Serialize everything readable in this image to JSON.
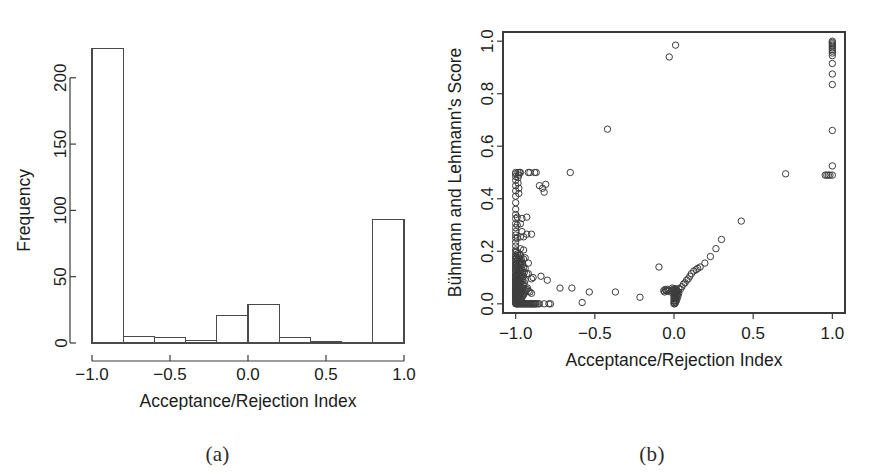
{
  "figure": {
    "background": "#ffffff",
    "ink_color": "#3a3a3a",
    "text_color": "#1c1c1c"
  },
  "panels": [
    {
      "id": "a",
      "caption": "(a)",
      "chart_ref": 0
    },
    {
      "id": "b",
      "caption": "(b)",
      "chart_ref": 1
    }
  ],
  "chart_data": [
    {
      "type": "bar",
      "subtype": "histogram",
      "title": "",
      "xlabel": "Acceptance/Rejection Index",
      "ylabel": "Frequency",
      "xlim": [
        -1.0,
        1.0
      ],
      "ylim": [
        0,
        230
      ],
      "xticks": [
        -1.0,
        -0.5,
        0.0,
        0.5,
        1.0
      ],
      "xtick_labels": [
        "-1.0",
        "-0.5",
        "0.0",
        "0.5",
        "1.0"
      ],
      "yticks": [
        0,
        50,
        100,
        150,
        200
      ],
      "ytick_labels": [
        "0",
        "50",
        "100",
        "150",
        "200"
      ],
      "grid": false,
      "legend": "none",
      "bin_width": 0.2,
      "bin_edges": [
        -1.0,
        -0.8,
        -0.6,
        -0.4,
        -0.2,
        0.0,
        0.2,
        0.4,
        0.6,
        0.8,
        1.0
      ],
      "categories": [
        "-1.0 to -0.8",
        "-0.8 to -0.6",
        "-0.6 to -0.4",
        "-0.4 to -0.2",
        "-0.2 to 0.0",
        "0.0 to 0.2",
        "0.2 to 0.4",
        "0.4 to 0.6",
        "0.6 to 0.8",
        "0.8 to 1.0"
      ],
      "values": [
        222,
        5,
        4,
        2,
        21,
        29,
        4,
        1,
        0,
        93
      ],
      "bar_fill": "#ffffff",
      "bar_stroke": "#4a4a4a"
    },
    {
      "type": "scatter",
      "title": "",
      "xlabel": "Acceptance/Rejection Index",
      "ylabel": "Bühmann and Lehmann's Score",
      "xlim": [
        -1.08,
        1.08
      ],
      "ylim": [
        -0.035,
        1.035
      ],
      "xticks": [
        -1.0,
        -0.5,
        0.0,
        0.5,
        1.0
      ],
      "xtick_labels": [
        "-1.0",
        "-0.5",
        "0.0",
        "0.5",
        "1.0"
      ],
      "yticks": [
        0.0,
        0.2,
        0.4,
        0.6,
        0.8,
        1.0
      ],
      "ytick_labels": [
        "0.0",
        "0.2",
        "0.4",
        "0.6",
        "0.8",
        "1.0"
      ],
      "grid": false,
      "legend": "none",
      "marker": "open-circle",
      "marker_size": 4.2,
      "marker_stroke": "#3d3d3d",
      "frame": true,
      "points": [
        [
          -1.0,
          0.0
        ],
        [
          -1.0,
          0.005
        ],
        [
          -1.0,
          0.01
        ],
        [
          -1.0,
          0.013
        ],
        [
          -1.0,
          0.017
        ],
        [
          -1.0,
          0.02
        ],
        [
          -1.0,
          0.024
        ],
        [
          -1.0,
          0.028
        ],
        [
          -1.0,
          0.032
        ],
        [
          -1.0,
          0.036
        ],
        [
          -1.0,
          0.04
        ],
        [
          -1.0,
          0.044
        ],
        [
          -1.0,
          0.048
        ],
        [
          -1.0,
          0.052
        ],
        [
          -1.0,
          0.056
        ],
        [
          -1.0,
          0.06
        ],
        [
          -1.0,
          0.065
        ],
        [
          -1.0,
          0.07
        ],
        [
          -1.0,
          0.075
        ],
        [
          -1.0,
          0.08
        ],
        [
          -1.0,
          0.085
        ],
        [
          -1.0,
          0.09
        ],
        [
          -1.0,
          0.095
        ],
        [
          -1.0,
          0.1
        ],
        [
          -1.0,
          0.105
        ],
        [
          -1.0,
          0.11
        ],
        [
          -1.0,
          0.118
        ],
        [
          -1.0,
          0.125
        ],
        [
          -1.0,
          0.132
        ],
        [
          -1.0,
          0.14
        ],
        [
          -1.0,
          0.148
        ],
        [
          -1.0,
          0.155
        ],
        [
          -1.0,
          0.162
        ],
        [
          -1.0,
          0.17
        ],
        [
          -1.0,
          0.178
        ],
        [
          -1.0,
          0.185
        ],
        [
          -1.0,
          0.195
        ],
        [
          -1.0,
          0.205
        ],
        [
          -1.0,
          0.22
        ],
        [
          -1.0,
          0.235
        ],
        [
          -1.0,
          0.25
        ],
        [
          -1.0,
          0.262
        ],
        [
          -1.0,
          0.275
        ],
        [
          -1.0,
          0.29
        ],
        [
          -1.0,
          0.305
        ],
        [
          -1.0,
          0.325
        ],
        [
          -1.0,
          0.34
        ],
        [
          -1.0,
          0.36
        ],
        [
          -1.0,
          0.385
        ],
        [
          -1.0,
          0.41
        ],
        [
          -1.0,
          0.43
        ],
        [
          -1.0,
          0.45
        ],
        [
          -1.0,
          0.47
        ],
        [
          -1.0,
          0.485
        ],
        [
          -1.0,
          0.495
        ],
        [
          -1.0,
          0.5
        ],
        [
          -0.995,
          0.0
        ],
        [
          -0.995,
          0.015
        ],
        [
          -0.995,
          0.03
        ],
        [
          -0.995,
          0.045
        ],
        [
          -0.995,
          0.06
        ],
        [
          -0.995,
          0.075
        ],
        [
          -0.995,
          0.09
        ],
        [
          -0.995,
          0.11
        ],
        [
          -0.995,
          0.13
        ],
        [
          -0.995,
          0.15
        ],
        [
          -0.995,
          0.175
        ],
        [
          -0.995,
          0.2
        ],
        [
          -0.99,
          0.0
        ],
        [
          -0.99,
          0.008
        ],
        [
          -0.99,
          0.018
        ],
        [
          -0.99,
          0.028
        ],
        [
          -0.99,
          0.038
        ],
        [
          -0.99,
          0.05
        ],
        [
          -0.99,
          0.062
        ],
        [
          -0.99,
          0.078
        ],
        [
          -0.99,
          0.095
        ],
        [
          -0.99,
          0.115
        ],
        [
          -0.99,
          0.14
        ],
        [
          -0.99,
          0.165
        ],
        [
          -0.99,
          0.19
        ],
        [
          -0.99,
          0.25
        ],
        [
          -0.99,
          0.3
        ],
        [
          -0.99,
          0.33
        ],
        [
          -0.985,
          0.0
        ],
        [
          -0.985,
          0.012
        ],
        [
          -0.985,
          0.025
        ],
        [
          -0.985,
          0.04
        ],
        [
          -0.985,
          0.055
        ],
        [
          -0.985,
          0.07
        ],
        [
          -0.985,
          0.088
        ],
        [
          -0.985,
          0.108
        ],
        [
          -0.985,
          0.13
        ],
        [
          -0.985,
          0.155
        ],
        [
          -0.985,
          0.185
        ],
        [
          -0.985,
          0.46
        ],
        [
          -0.985,
          0.48
        ],
        [
          -0.985,
          0.5
        ],
        [
          -0.98,
          0.0
        ],
        [
          -0.98,
          0.01
        ],
        [
          -0.98,
          0.022
        ],
        [
          -0.98,
          0.035
        ],
        [
          -0.98,
          0.05
        ],
        [
          -0.98,
          0.065
        ],
        [
          -0.98,
          0.082
        ],
        [
          -0.98,
          0.1
        ],
        [
          -0.98,
          0.125
        ],
        [
          -0.98,
          0.15
        ],
        [
          -0.98,
          0.175
        ],
        [
          -0.98,
          0.42
        ],
        [
          -0.98,
          0.44
        ],
        [
          -0.98,
          0.49
        ],
        [
          -0.975,
          0.0
        ],
        [
          -0.975,
          0.015
        ],
        [
          -0.975,
          0.032
        ],
        [
          -0.975,
          0.048
        ],
        [
          -0.975,
          0.065
        ],
        [
          -0.975,
          0.085
        ],
        [
          -0.975,
          0.105
        ],
        [
          -0.975,
          0.13
        ],
        [
          -0.975,
          0.16
        ],
        [
          -0.975,
          0.185
        ],
        [
          -0.975,
          0.5
        ],
        [
          -0.97,
          0.0
        ],
        [
          -0.97,
          0.018
        ],
        [
          -0.97,
          0.038
        ],
        [
          -0.97,
          0.058
        ],
        [
          -0.97,
          0.078
        ],
        [
          -0.97,
          0.1
        ],
        [
          -0.97,
          0.125
        ],
        [
          -0.97,
          0.155
        ],
        [
          -0.97,
          0.185
        ],
        [
          -0.97,
          0.21
        ],
        [
          -0.97,
          0.255
        ],
        [
          -0.97,
          0.305
        ],
        [
          -0.97,
          0.5
        ],
        [
          -0.965,
          0.0
        ],
        [
          -0.965,
          0.02
        ],
        [
          -0.965,
          0.042
        ],
        [
          -0.965,
          0.062
        ],
        [
          -0.965,
          0.085
        ],
        [
          -0.965,
          0.11
        ],
        [
          -0.965,
          0.14
        ],
        [
          -0.965,
          0.17
        ],
        [
          -0.96,
          0.0
        ],
        [
          -0.96,
          0.025
        ],
        [
          -0.96,
          0.05
        ],
        [
          -0.96,
          0.075
        ],
        [
          -0.96,
          0.1
        ],
        [
          -0.96,
          0.13
        ],
        [
          -0.96,
          0.16
        ],
        [
          -0.96,
          0.275
        ],
        [
          -0.96,
          0.325
        ],
        [
          -0.955,
          0.0
        ],
        [
          -0.955,
          0.03
        ],
        [
          -0.955,
          0.06
        ],
        [
          -0.955,
          0.09
        ],
        [
          -0.955,
          0.12
        ],
        [
          -0.955,
          0.15
        ],
        [
          -0.95,
          0.0
        ],
        [
          -0.95,
          0.035
        ],
        [
          -0.95,
          0.07
        ],
        [
          -0.95,
          0.105
        ],
        [
          -0.95,
          0.14
        ],
        [
          -0.95,
          0.17
        ],
        [
          -0.95,
          0.205
        ],
        [
          -0.95,
          0.255
        ],
        [
          -0.945,
          0.0
        ],
        [
          -0.945,
          0.04
        ],
        [
          -0.945,
          0.08
        ],
        [
          -0.945,
          0.12
        ],
        [
          -0.94,
          0.0
        ],
        [
          -0.94,
          0.045
        ],
        [
          -0.94,
          0.09
        ],
        [
          -0.94,
          0.135
        ],
        [
          -0.94,
          0.175
        ],
        [
          -0.935,
          0.0
        ],
        [
          -0.935,
          0.05
        ],
        [
          -0.93,
          0.0
        ],
        [
          -0.93,
          0.055
        ],
        [
          -0.93,
          0.115
        ],
        [
          -0.93,
          0.265
        ],
        [
          -0.93,
          0.33
        ],
        [
          -0.925,
          0.0
        ],
        [
          -0.925,
          0.06
        ],
        [
          -0.92,
          0.0
        ],
        [
          -0.92,
          0.048
        ],
        [
          -0.92,
          0.115
        ],
        [
          -0.92,
          0.155
        ],
        [
          -0.92,
          0.5
        ],
        [
          -0.915,
          0.0
        ],
        [
          -0.91,
          0.0
        ],
        [
          -0.91,
          0.045
        ],
        [
          -0.91,
          0.5
        ],
        [
          -0.905,
          0.0
        ],
        [
          -0.9,
          0.0
        ],
        [
          -0.9,
          0.04
        ],
        [
          -0.9,
          0.095
        ],
        [
          -0.9,
          0.265
        ],
        [
          -0.895,
          0.0
        ],
        [
          -0.89,
          0.0
        ],
        [
          -0.89,
          0.1
        ],
        [
          -0.885,
          0.0
        ],
        [
          -0.88,
          0.0
        ],
        [
          -0.88,
          0.5
        ],
        [
          -0.875,
          0.0
        ],
        [
          -0.87,
          0.0
        ],
        [
          -0.87,
          0.5
        ],
        [
          -0.86,
          0.0
        ],
        [
          -0.85,
          0.0
        ],
        [
          -0.85,
          0.45
        ],
        [
          -0.84,
          0.105
        ],
        [
          -0.83,
          0.44
        ],
        [
          -0.82,
          0.0
        ],
        [
          -0.82,
          0.425
        ],
        [
          -0.81,
          0.455
        ],
        [
          -0.8,
          0.09
        ],
        [
          -0.79,
          0.0
        ],
        [
          -0.78,
          0.0
        ],
        [
          -0.72,
          0.06
        ],
        [
          -0.655,
          0.5
        ],
        [
          -0.645,
          0.06
        ],
        [
          -0.58,
          0.005
        ],
        [
          -0.535,
          0.045
        ],
        [
          -0.42,
          0.665
        ],
        [
          -0.37,
          0.045
        ],
        [
          -0.215,
          0.025
        ],
        [
          -0.095,
          0.14
        ],
        [
          -0.065,
          0.05
        ],
        [
          -0.06,
          0.045
        ],
        [
          -0.055,
          0.055
        ],
        [
          -0.05,
          0.05
        ],
        [
          -0.045,
          0.048
        ],
        [
          -0.04,
          0.055
        ],
        [
          -0.035,
          0.05
        ],
        [
          -0.03,
          0.94
        ],
        [
          -0.02,
          0.045
        ],
        [
          -0.015,
          0.05
        ],
        [
          -0.01,
          0.06
        ],
        [
          -0.005,
          0.055
        ],
        [
          0.0,
          0.0
        ],
        [
          0.0,
          0.005
        ],
        [
          0.0,
          0.012
        ],
        [
          0.0,
          0.02
        ],
        [
          0.0,
          0.028
        ],
        [
          0.0,
          0.035
        ],
        [
          0.0,
          0.042
        ],
        [
          0.0,
          0.05
        ],
        [
          0.005,
          0.0
        ],
        [
          0.005,
          0.01
        ],
        [
          0.005,
          0.022
        ],
        [
          0.005,
          0.033
        ],
        [
          0.005,
          0.045
        ],
        [
          0.005,
          0.058
        ],
        [
          0.01,
          0.005
        ],
        [
          0.01,
          0.018
        ],
        [
          0.01,
          0.03
        ],
        [
          0.01,
          0.042
        ],
        [
          0.01,
          0.055
        ],
        [
          0.01,
          0.985
        ],
        [
          0.015,
          0.012
        ],
        [
          0.015,
          0.025
        ],
        [
          0.015,
          0.04
        ],
        [
          0.015,
          0.052
        ],
        [
          0.02,
          0.02
        ],
        [
          0.02,
          0.035
        ],
        [
          0.02,
          0.05
        ],
        [
          0.025,
          0.03
        ],
        [
          0.025,
          0.045
        ],
        [
          0.03,
          0.04
        ],
        [
          0.03,
          0.058
        ],
        [
          0.04,
          0.055
        ],
        [
          0.05,
          0.065
        ],
        [
          0.06,
          0.075
        ],
        [
          0.07,
          0.08
        ],
        [
          0.08,
          0.09
        ],
        [
          0.09,
          0.095
        ],
        [
          0.1,
          0.105
        ],
        [
          0.11,
          0.115
        ],
        [
          0.125,
          0.125
        ],
        [
          0.14,
          0.13
        ],
        [
          0.15,
          0.135
        ],
        [
          0.165,
          0.14
        ],
        [
          0.195,
          0.155
        ],
        [
          0.23,
          0.18
        ],
        [
          0.265,
          0.21
        ],
        [
          0.3,
          0.245
        ],
        [
          0.425,
          0.315
        ],
        [
          0.705,
          0.495
        ],
        [
          0.955,
          0.49
        ],
        [
          0.965,
          0.49
        ],
        [
          0.975,
          0.49
        ],
        [
          0.985,
          0.49
        ],
        [
          1.0,
          0.49
        ],
        [
          1.0,
          0.525
        ],
        [
          1.0,
          0.66
        ],
        [
          1.0,
          0.835
        ],
        [
          1.0,
          0.875
        ],
        [
          1.0,
          0.915
        ],
        [
          1.0,
          0.945
        ],
        [
          1.0,
          0.955
        ],
        [
          1.0,
          0.962
        ],
        [
          1.0,
          0.968
        ],
        [
          1.0,
          0.974
        ],
        [
          1.0,
          0.98
        ],
        [
          1.0,
          0.985
        ],
        [
          1.0,
          0.99
        ],
        [
          1.0,
          0.995
        ],
        [
          1.0,
          1.0
        ]
      ]
    }
  ]
}
